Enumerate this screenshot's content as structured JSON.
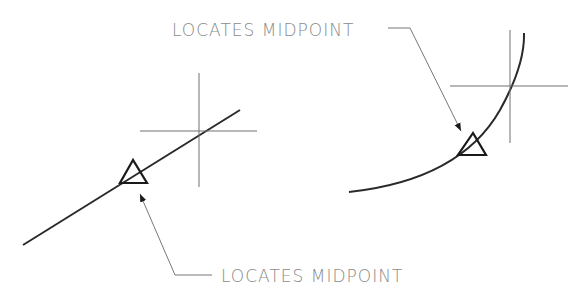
{
  "diagram": {
    "left_example": {
      "label": "LOCATES MIDPOINT",
      "object": "line"
    },
    "right_example": {
      "label": "LOCATES MIDPOINT",
      "object": "arc"
    },
    "colors": {
      "object_stroke": "#2a2a2a",
      "crosshair_stroke": "#707070",
      "label_text": "#8a8a8a",
      "background": "#ffffff"
    }
  }
}
